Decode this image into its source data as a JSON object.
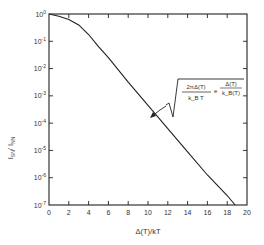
{
  "chart_data": {
    "type": "line",
    "title": "",
    "xlabel": "Δ(T)/kT",
    "ylabel": "I_SN / I_NN",
    "xlim": [
      0,
      20
    ],
    "ylim_log10": [
      -7,
      0
    ],
    "yscale": "log",
    "grid": false,
    "x_ticks": [
      0,
      2,
      4,
      6,
      8,
      10,
      12,
      14,
      16,
      18,
      20
    ],
    "x_tick_labels": [
      "0",
      "2",
      "4",
      "6",
      "8",
      "10",
      "12",
      "14",
      "16",
      "18",
      "20"
    ],
    "y_tick_exponents": [
      0,
      -1,
      -2,
      -3,
      -4,
      -5,
      -6,
      -7
    ],
    "y_tick_labels": [
      "10⁰",
      "10⁻¹",
      "10⁻²",
      "10⁻³",
      "10⁻⁴",
      "10⁻⁵",
      "10⁻⁶",
      "10⁻⁷"
    ],
    "series": [
      {
        "name": "I_SN/I_NN",
        "x": [
          0,
          1,
          2,
          3,
          4,
          5,
          6,
          8,
          10,
          12,
          14,
          16,
          18,
          18.8
        ],
        "y_log10": [
          0,
          -0.08,
          -0.2,
          -0.4,
          -0.75,
          -1.2,
          -1.6,
          -2.5,
          -3.35,
          -4.2,
          -5.05,
          -5.9,
          -6.65,
          -7.0
        ]
      }
    ],
    "annotations": [
      {
        "text": "√(2πΔ(T)/(k_B T)) · e^(−Δ(T)/(k_B(T)))",
        "sqrt_numerator": "2πΔ(T)",
        "sqrt_denominator": "k_B T",
        "exp_symbol": "e",
        "exp_numerator": "Δ(T)",
        "exp_denominator": "k_B(T)",
        "arrow_to_x": 10.5
      }
    ]
  },
  "labels": {
    "xlabel": "Δ(T)/kT",
    "ylabel_main": "I",
    "ylabel_sub1": "SN",
    "ylabel_slash": "/ I",
    "ylabel_sub2": "NN"
  }
}
